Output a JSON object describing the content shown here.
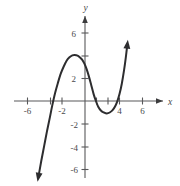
{
  "chart_data": {
    "type": "line",
    "title": "",
    "subtitle": "",
    "xlabel": "x",
    "ylabel": "y",
    "xlim": [
      -8,
      8
    ],
    "ylim": [
      -7.4,
      7.4
    ],
    "grid": false,
    "legend": null,
    "x_ticks": [
      -6,
      -4,
      -2,
      2,
      4,
      6
    ],
    "y_ticks": [
      -6,
      -4,
      -2,
      2,
      6
    ],
    "x_tick_labels": [
      "-6",
      "",
      "-2",
      "",
      "4",
      "6"
    ],
    "y_tick_labels": [
      "-6",
      "-4",
      "-2",
      "2",
      "6"
    ],
    "x_labeled_values": [
      -6,
      -2,
      4,
      6
    ],
    "y_labeled_values": [
      -6,
      -4,
      -2,
      2,
      6
    ],
    "axis_arrows": [
      "x-positive",
      "y-positive"
    ],
    "annotations": [],
    "curve_end_arrows": [
      "down-left",
      "up-right"
    ],
    "features": {
      "local_maximum": [
        -1.0,
        4.0
      ],
      "local_minimum": [
        2.0,
        -1.0
      ],
      "x_intercepts": [
        -3.0,
        1.0
      ],
      "y_intercept": 3.0
    },
    "series": [
      {
        "name": "curve",
        "color": "#2d2d2f",
        "points": [
          [
            -4.05,
            -6.6
          ],
          [
            -3.8,
            -5.2
          ],
          [
            -3.55,
            -3.9
          ],
          [
            -3.3,
            -2.6
          ],
          [
            -3.05,
            -1.4
          ],
          [
            -2.85,
            -0.4
          ],
          [
            -2.6,
            0.7
          ],
          [
            -2.35,
            1.6
          ],
          [
            -2.1,
            2.4
          ],
          [
            -1.85,
            3.0
          ],
          [
            -1.6,
            3.5
          ],
          [
            -1.35,
            3.8
          ],
          [
            -1.1,
            3.97
          ],
          [
            -0.9,
            4.0
          ],
          [
            -0.65,
            3.95
          ],
          [
            -0.45,
            3.8
          ],
          [
            -0.25,
            3.6
          ],
          [
            -0.05,
            3.25
          ],
          [
            0.15,
            2.75
          ],
          [
            0.35,
            2.1
          ],
          [
            0.55,
            1.35
          ],
          [
            0.75,
            0.6
          ],
          [
            0.95,
            0.0
          ],
          [
            1.15,
            -0.5
          ],
          [
            1.4,
            -0.85
          ],
          [
            1.65,
            -1.0
          ],
          [
            1.9,
            -1.08
          ],
          [
            2.15,
            -1.0
          ],
          [
            2.4,
            -0.8
          ],
          [
            2.6,
            -0.5
          ],
          [
            2.8,
            -0.05
          ],
          [
            3.0,
            0.6
          ],
          [
            3.2,
            1.5
          ],
          [
            3.4,
            2.7
          ],
          [
            3.55,
            3.8
          ],
          [
            3.68,
            4.9
          ]
        ]
      }
    ]
  },
  "axes": {
    "x_name": "x",
    "y_name": "y"
  }
}
